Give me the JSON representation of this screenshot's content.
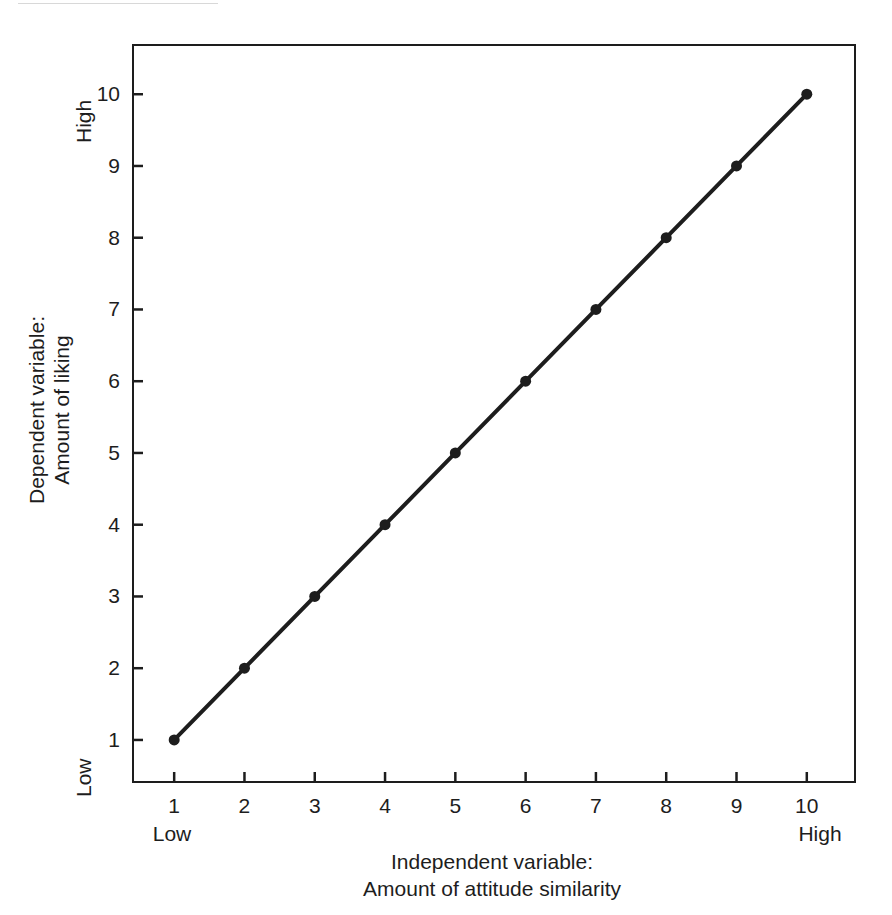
{
  "figure": {
    "background_color": "#ffffff",
    "ink_color": "#1d1d1d"
  },
  "y_axis": {
    "title_line1": "Dependent variable:",
    "title_line2": "Amount of liking",
    "low_label": "Low",
    "high_label": "High",
    "ticks": [
      "1",
      "2",
      "3",
      "4",
      "5",
      "6",
      "7",
      "8",
      "9",
      "10"
    ]
  },
  "x_axis": {
    "title_line1": "Independent variable:",
    "title_line2": "Amount of attitude similarity",
    "low_label": "Low",
    "high_label": "High",
    "ticks": [
      "1",
      "2",
      "3",
      "4",
      "5",
      "6",
      "7",
      "8",
      "9",
      "10"
    ]
  },
  "chart_data": {
    "type": "line",
    "title": "",
    "xlabel": "Independent variable: Amount of attitude similarity",
    "ylabel": "Dependent variable: Amount of liking",
    "xlim": [
      0.4,
      10.7
    ],
    "ylim": [
      0.4,
      10.7
    ],
    "grid": false,
    "legend": null,
    "marker": "filled-circle",
    "line_color": "#1d1d1d",
    "x": [
      1,
      2,
      3,
      4,
      5,
      6,
      7,
      8,
      9,
      10
    ],
    "series": [
      {
        "name": "Amount of liking",
        "values": [
          1,
          2,
          3,
          4,
          5,
          6,
          7,
          8,
          9,
          10
        ]
      }
    ],
    "xtick_labels": [
      "1",
      "2",
      "3",
      "4",
      "5",
      "6",
      "7",
      "8",
      "9",
      "10"
    ],
    "ytick_labels": [
      "1",
      "2",
      "3",
      "4",
      "5",
      "6",
      "7",
      "8",
      "9",
      "10"
    ],
    "x_end_annotations": {
      "left": "Low",
      "right": "High"
    },
    "y_end_annotations": {
      "bottom": "Low",
      "top": "High"
    }
  }
}
